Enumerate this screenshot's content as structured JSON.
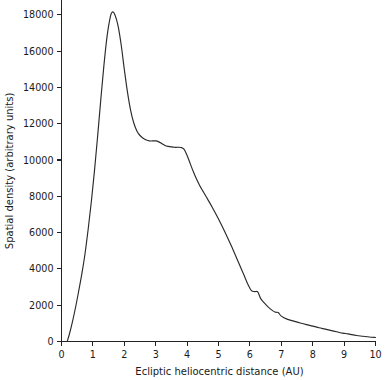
{
  "chart_data": {
    "type": "line",
    "title": "",
    "xlabel": "Ecliptic heliocentric distance (AU)",
    "ylabel": "Spatial density (arbitrary units)",
    "xlim": [
      0,
      10
    ],
    "ylim": [
      0,
      18800
    ],
    "grid": false,
    "legend": null,
    "xticks": [
      0,
      1,
      2,
      3,
      4,
      5,
      6,
      7,
      8,
      9,
      10
    ],
    "xticklabels": [
      "0",
      "1",
      "2",
      "3",
      "4",
      "5",
      "6",
      "7",
      "8",
      "9",
      "10"
    ],
    "yticks": [
      0,
      2000,
      4000,
      6000,
      8000,
      10000,
      12000,
      14000,
      16000,
      18000
    ],
    "yticklabels": [
      "0",
      "2000",
      "4000",
      "6000",
      "8000",
      "10000",
      "12000",
      "14000",
      "16000",
      "18000"
    ],
    "series": [
      {
        "name": "Spatial density",
        "color": "#2a2a2a",
        "x": [
          0.18,
          0.25,
          0.35,
          0.45,
          0.55,
          0.65,
          0.75,
          0.85,
          0.95,
          1.05,
          1.15,
          1.25,
          1.35,
          1.45,
          1.55,
          1.62,
          1.7,
          1.8,
          1.9,
          2.0,
          2.1,
          2.2,
          2.3,
          2.4,
          2.5,
          2.6,
          2.7,
          2.8,
          2.9,
          3.0,
          3.1,
          3.2,
          3.3,
          3.4,
          3.5,
          3.6,
          3.7,
          3.8,
          3.9,
          4.0,
          4.1,
          4.2,
          4.3,
          4.4,
          4.5,
          4.6,
          4.8,
          5.0,
          5.2,
          5.4,
          5.6,
          5.8,
          5.95,
          6.05,
          6.15,
          6.25,
          6.35,
          6.5,
          6.65,
          6.8,
          6.9,
          7.0,
          7.2,
          7.4,
          7.6,
          7.8,
          8.0,
          8.2,
          8.4,
          8.6,
          8.8,
          8.95,
          9.05,
          9.2,
          9.4,
          9.6,
          9.8,
          10.0
        ],
        "y": [
          0,
          400,
          1100,
          1900,
          2800,
          3750,
          4850,
          6200,
          7700,
          9400,
          11300,
          13300,
          15200,
          16800,
          17850,
          18150,
          18000,
          17400,
          16350,
          15000,
          13750,
          12750,
          12050,
          11600,
          11350,
          11200,
          11100,
          11050,
          11050,
          11050,
          11000,
          10900,
          10800,
          10750,
          10720,
          10700,
          10700,
          10690,
          10600,
          10250,
          9800,
          9350,
          8950,
          8600,
          8300,
          8000,
          7400,
          6750,
          6050,
          5300,
          4500,
          3700,
          3100,
          2800,
          2750,
          2730,
          2350,
          2050,
          1800,
          1620,
          1600,
          1400,
          1220,
          1120,
          1020,
          930,
          850,
          760,
          680,
          600,
          520,
          460,
          440,
          390,
          330,
          290,
          250,
          220
        ]
      }
    ]
  },
  "axis_labels": {
    "x_title": "Ecliptic heliocentric distance (AU)",
    "y_title": "Spatial density (arbitrary units)"
  }
}
